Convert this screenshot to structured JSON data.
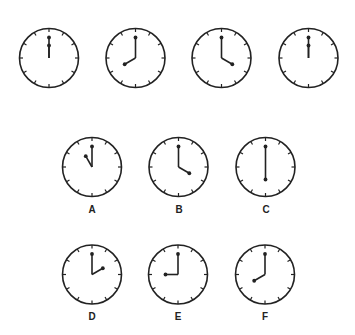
{
  "puzzle": {
    "sequence_row": {
      "clocks": [
        {
          "time": "12:00",
          "hour": 12,
          "minute": 0,
          "cx": 49,
          "cy": 58
        },
        {
          "time": "8:00",
          "hour": 8,
          "minute": 0,
          "cx": 135.5,
          "cy": 58
        },
        {
          "time": "4:00",
          "hour": 4,
          "minute": 0,
          "cx": 221.5,
          "cy": 58
        },
        {
          "time": "12:00",
          "hour": 12,
          "minute": 0,
          "cx": 308.5,
          "cy": 58
        }
      ]
    },
    "options": [
      {
        "label": "A",
        "time": "11:00",
        "hour": 11,
        "minute": 0,
        "cx": 92,
        "cy": 167,
        "label_y": 203
      },
      {
        "label": "B",
        "time": "4:00",
        "hour": 4,
        "minute": 0,
        "cx": 178.5,
        "cy": 167,
        "label_y": 203
      },
      {
        "label": "C",
        "time": "6:00",
        "hour": 6,
        "minute": 0,
        "cx": 265.5,
        "cy": 167,
        "label_y": 203
      },
      {
        "label": "D",
        "time": "2:00",
        "hour": 2,
        "minute": 0,
        "cx": 92,
        "cy": 274.5,
        "label_y": 310
      },
      {
        "label": "E",
        "time": "9:00",
        "hour": 9,
        "minute": 0,
        "cx": 178,
        "cy": 274.5,
        "label_y": 310
      },
      {
        "label": "F",
        "time": "8:00",
        "hour": 8,
        "minute": 0,
        "cx": 265,
        "cy": 274.5,
        "label_y": 310
      }
    ],
    "style": {
      "stroke_color": "#222222",
      "background": "#ffffff",
      "radius": 29.5,
      "tick_length": 3.5,
      "minute_hand_length": 20.5,
      "hour_hand_length": 12.5
    }
  }
}
